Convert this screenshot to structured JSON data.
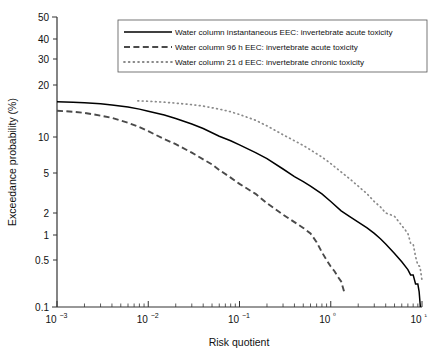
{
  "chart_data": {
    "type": "line",
    "title": "",
    "xlabel": "Risk quotient",
    "ylabel": "Exceedance probability (%)",
    "xscale": "log",
    "yscale": "probability",
    "xlim": [
      0.001,
      10
    ],
    "ylim": [
      0.1,
      50
    ],
    "grid": false,
    "legend_position": "top-center",
    "x_tick_labels": [
      "10−3",
      "10−2",
      "10−1",
      "10⁰",
      "10¹"
    ],
    "x_tick_values": [
      0.001,
      0.01,
      0.1,
      1,
      10
    ],
    "y_tick_labels": [
      "50",
      "40",
      "30",
      "20",
      "10",
      "5",
      "2",
      "1",
      "0.5",
      "0.1"
    ],
    "y_tick_values": [
      50,
      40,
      30,
      20,
      10,
      5,
      2,
      1,
      0.5,
      0.1
    ],
    "series": [
      {
        "name": "Water column instantaneous EEC: invertebrate acute toxicity",
        "style": "solid",
        "color": "#000000",
        "points": [
          [
            0.001,
            16.0
          ],
          [
            0.0015,
            15.9
          ],
          [
            0.002,
            15.8
          ],
          [
            0.003,
            15.6
          ],
          [
            0.004,
            15.3
          ],
          [
            0.006,
            14.9
          ],
          [
            0.008,
            14.5
          ],
          [
            0.01,
            14.1
          ],
          [
            0.015,
            13.4
          ],
          [
            0.02,
            12.8
          ],
          [
            0.03,
            11.9
          ],
          [
            0.04,
            11.2
          ],
          [
            0.06,
            10.1
          ],
          [
            0.08,
            9.3
          ],
          [
            0.1,
            8.6
          ],
          [
            0.15,
            7.4
          ],
          [
            0.2,
            6.6
          ],
          [
            0.3,
            5.4
          ],
          [
            0.4,
            4.6
          ],
          [
            0.5,
            4.1
          ],
          [
            0.6,
            3.7
          ],
          [
            0.8,
            3.1
          ],
          [
            1.0,
            2.6
          ],
          [
            1.3,
            2.1
          ],
          [
            1.6,
            1.8
          ],
          [
            2.0,
            1.5
          ],
          [
            2.5,
            1.25
          ],
          [
            3.0,
            1.05
          ],
          [
            3.5,
            0.9
          ],
          [
            4.0,
            0.78
          ],
          [
            5.0,
            0.6
          ],
          [
            6.0,
            0.47
          ],
          [
            7.0,
            0.36
          ],
          [
            7.5,
            0.3
          ],
          [
            8.0,
            0.3
          ],
          [
            8.5,
            0.22
          ],
          [
            9.0,
            0.22
          ],
          [
            9.3,
            0.17
          ],
          [
            9.6,
            0.1
          ]
        ]
      },
      {
        "name": "Water column 96 h EEC: invertebrate acute toxicity",
        "style": "dashed",
        "color": "#4a4a4a",
        "points": [
          [
            0.001,
            14.2
          ],
          [
            0.0015,
            14.0
          ],
          [
            0.002,
            13.8
          ],
          [
            0.003,
            13.3
          ],
          [
            0.004,
            12.9
          ],
          [
            0.006,
            12.1
          ],
          [
            0.008,
            11.4
          ],
          [
            0.01,
            10.8
          ],
          [
            0.015,
            9.6
          ],
          [
            0.02,
            8.7
          ],
          [
            0.03,
            7.4
          ],
          [
            0.04,
            6.5
          ],
          [
            0.05,
            5.9
          ],
          [
            0.06,
            5.3
          ],
          [
            0.08,
            4.5
          ],
          [
            0.1,
            3.9
          ],
          [
            0.15,
            3.1
          ],
          [
            0.2,
            2.5
          ],
          [
            0.3,
            1.9
          ],
          [
            0.4,
            1.5
          ],
          [
            0.5,
            1.25
          ],
          [
            0.6,
            1.05
          ],
          [
            0.7,
            0.82
          ],
          [
            0.8,
            0.62
          ],
          [
            0.9,
            0.5
          ],
          [
            1.0,
            0.4
          ],
          [
            1.1,
            0.34
          ],
          [
            1.2,
            0.28
          ],
          [
            1.3,
            0.24
          ],
          [
            1.4,
            0.17
          ]
        ]
      },
      {
        "name": "Water column 21 d EEC: invertebrate chronic toxicity",
        "style": "dotted",
        "color": "#8a8a8a",
        "points": [
          [
            0.0077,
            16.2
          ],
          [
            0.01,
            16.1
          ],
          [
            0.015,
            15.9
          ],
          [
            0.02,
            15.7
          ],
          [
            0.03,
            15.4
          ],
          [
            0.04,
            15.1
          ],
          [
            0.06,
            14.5
          ],
          [
            0.08,
            14.0
          ],
          [
            0.1,
            13.5
          ],
          [
            0.15,
            12.5
          ],
          [
            0.2,
            11.6
          ],
          [
            0.3,
            10.3
          ],
          [
            0.4,
            9.3
          ],
          [
            0.5,
            8.5
          ],
          [
            0.6,
            7.8
          ],
          [
            0.8,
            6.8
          ],
          [
            1.0,
            6.0
          ],
          [
            1.3,
            5.1
          ],
          [
            1.6,
            4.4
          ],
          [
            2.0,
            3.7
          ],
          [
            2.5,
            3.1
          ],
          [
            3.0,
            2.6
          ],
          [
            3.5,
            2.3
          ],
          [
            4.0,
            2.0
          ],
          [
            4.5,
            1.9
          ],
          [
            5.0,
            1.8
          ],
          [
            6.0,
            1.35
          ],
          [
            7.0,
            1.05
          ],
          [
            7.5,
            0.8
          ],
          [
            8.0,
            0.78
          ],
          [
            8.5,
            0.55
          ],
          [
            9.0,
            0.42
          ],
          [
            9.5,
            0.4
          ],
          [
            10.0,
            0.25
          ]
        ]
      }
    ],
    "legend": [
      {
        "label": "Water column instantaneous EEC: invertebrate acute toxicity",
        "style": "solid"
      },
      {
        "label": "Water column 96 h EEC: invertebrate acute toxicity",
        "style": "dashed"
      },
      {
        "label": "Water column 21 d EEC: invertebrate chronic toxicity",
        "style": "dotted"
      }
    ]
  }
}
